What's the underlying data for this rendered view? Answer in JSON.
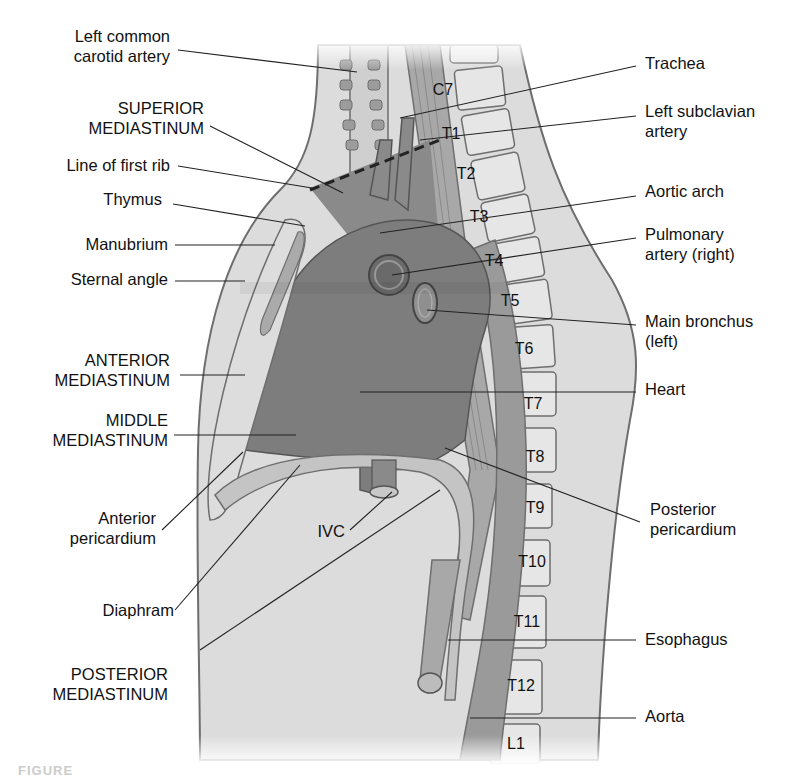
{
  "figure": {
    "caption_fragment": "FIGURE",
    "colors": {
      "background": "#ffffff",
      "body_fill": "#dcdcdc",
      "outline": "#6e6e6e",
      "heart_fill": "#7d7d7d",
      "superior_mediastinum_fill": "#8a8a8a",
      "vertebra_fill": "#e6e6e6",
      "aorta_fill": "#9a9a9a",
      "leader_line": "#222222"
    }
  },
  "labels_left": [
    {
      "id": "left-common-carotid-artery",
      "lines": [
        "Left common",
        "carotid artery"
      ]
    },
    {
      "id": "superior-mediastinum",
      "lines": [
        "SUPERIOR",
        "MEDIASTINUM"
      ]
    },
    {
      "id": "line-of-first-rib",
      "lines": [
        "Line of first rib"
      ]
    },
    {
      "id": "thymus",
      "lines": [
        "Thymus"
      ]
    },
    {
      "id": "manubrium",
      "lines": [
        "Manubrium"
      ]
    },
    {
      "id": "sternal-angle",
      "lines": [
        "Sternal angle"
      ]
    },
    {
      "id": "anterior-mediastinum",
      "lines": [
        "ANTERIOR",
        "MEDIASTINUM"
      ]
    },
    {
      "id": "middle-mediastinum",
      "lines": [
        "MIDDLE",
        "MEDIASTINUM"
      ]
    },
    {
      "id": "anterior-pericardium",
      "lines": [
        "Anterior",
        "pericardium"
      ]
    },
    {
      "id": "ivc",
      "lines": [
        "IVC"
      ]
    },
    {
      "id": "diaphram",
      "lines": [
        "Diaphram"
      ]
    },
    {
      "id": "posterior-mediastinum",
      "lines": [
        "POSTERIOR",
        "MEDIASTINUM"
      ]
    }
  ],
  "labels_right": [
    {
      "id": "trachea",
      "lines": [
        "Trachea"
      ]
    },
    {
      "id": "left-subclavian-artery",
      "lines": [
        "Left subclavian",
        "artery"
      ]
    },
    {
      "id": "aortic-arch",
      "lines": [
        "Aortic arch"
      ]
    },
    {
      "id": "pulmonary-artery-right",
      "lines": [
        "Pulmonary",
        "artery (right)"
      ]
    },
    {
      "id": "main-bronchus-left",
      "lines": [
        "Main bronchus",
        "(left)"
      ]
    },
    {
      "id": "heart",
      "lines": [
        "Heart"
      ]
    },
    {
      "id": "posterior-pericardium",
      "lines": [
        "Posterior",
        "pericardium"
      ]
    },
    {
      "id": "esophagus",
      "lines": [
        "Esophagus"
      ]
    },
    {
      "id": "aorta",
      "lines": [
        "Aorta"
      ]
    }
  ],
  "vertebrae": [
    "C7",
    "T1",
    "T2",
    "T3",
    "T4",
    "T5",
    "T6",
    "T7",
    "T8",
    "T9",
    "T10",
    "T11",
    "T12",
    "L1"
  ]
}
